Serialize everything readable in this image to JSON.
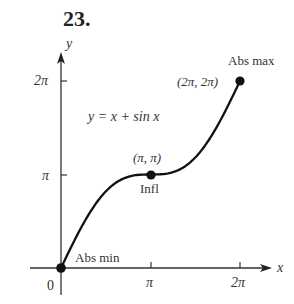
{
  "problem_number": "23.",
  "chart_data": {
    "type": "line",
    "title": "",
    "equation": "y = x + sin x",
    "xlabel": "x",
    "ylabel": "y",
    "x_ticks": [
      {
        "value": 3.14159,
        "label": "π"
      },
      {
        "value": 6.28319,
        "label": "2π"
      }
    ],
    "y_ticks": [
      {
        "value": 3.14159,
        "label": "π"
      },
      {
        "value": 6.28319,
        "label": "2π"
      }
    ],
    "origin_label": "0",
    "xlim": [
      0,
      6.28319
    ],
    "ylim": [
      0,
      6.28319
    ],
    "grid": false,
    "series": [
      {
        "name": "y = x + sin x",
        "function": "x + sin(x)",
        "domain": [
          0,
          6.28319
        ]
      }
    ],
    "points": [
      {
        "x": 0,
        "y": 0,
        "coord_label": "",
        "annotation": "Abs min"
      },
      {
        "x": 3.14159,
        "y": 3.14159,
        "coord_label": "(π, π)",
        "annotation": "Infl"
      },
      {
        "x": 6.28319,
        "y": 6.28319,
        "coord_label": "(2π, 2π)",
        "annotation": "Abs max"
      }
    ]
  },
  "labels": {
    "equation": "y = x + sin x",
    "x_axis": "x",
    "y_axis": "y",
    "origin": "0",
    "x_tick_pi": "π",
    "x_tick_2pi": "2π",
    "y_tick_pi": "π",
    "y_tick_2pi": "2π",
    "abs_min": "Abs min",
    "infl": "Infl",
    "infl_coord": "(π, π)",
    "abs_max": "Abs max",
    "max_coord": "(2π, 2π)"
  }
}
